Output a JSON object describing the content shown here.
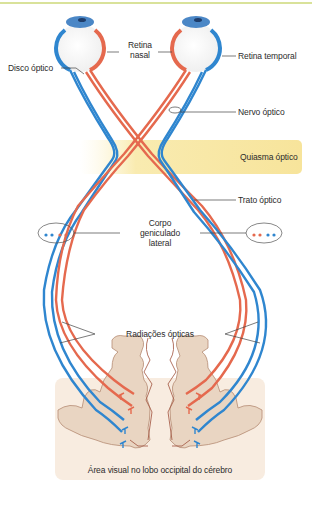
{
  "diagram": {
    "type": "visual pathway anatomy",
    "colors": {
      "nasal_fibers": "#e5694e",
      "temporal_fibers": "#2f86cf",
      "chiasm_band": "#f8e7a4",
      "cortex": "#e8d3c0",
      "cortex_bg": "#f8ece0",
      "top_rule": "#d9e29a"
    },
    "labels": {
      "disco_optico": "Disco óptico",
      "retina_nasal_1": "Retina",
      "retina_nasal_2": "nasal",
      "retina_temporal": "Retina temporal",
      "nervo_optico": "Nervo óptico",
      "quiasma_optico": "Quiasma óptico",
      "trato_optico": "Trato óptico",
      "corpo_1": "Corpo",
      "corpo_2": "geniculado",
      "corpo_3": "lateral",
      "radiacoes_opticas": "Radiações ópticas",
      "area_visual": "Área visual no lobo occipital do cérebro"
    }
  }
}
